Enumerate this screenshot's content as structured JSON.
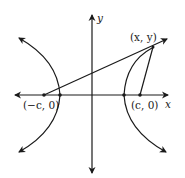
{
  "diagram": {
    "type": "hyperbola",
    "axes": {
      "x_label": "x",
      "y_label": "y"
    },
    "points": {
      "left_focus": "(−c, 0)",
      "right_focus": "(c, 0)",
      "point_on_curve": "(x, y)"
    },
    "colors": {
      "stroke": "#1a1a1a",
      "background": "#ffffff"
    }
  }
}
